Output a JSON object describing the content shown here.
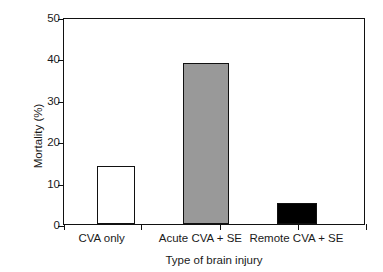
{
  "chart_data": {
    "type": "bar",
    "title": "",
    "subtitle": "",
    "xlabel": "Type of brain injury",
    "ylabel": "Mortality (%)",
    "categories": [
      "CVA only",
      "Acute CVA + SE",
      "Remote CVA + SE"
    ],
    "values": [
      14,
      39,
      5
    ],
    "series": [
      {
        "name": "Mortality",
        "values": [
          14,
          39,
          5
        ]
      }
    ],
    "ylim": [
      0,
      50
    ],
    "yticks": [
      0,
      10,
      20,
      30,
      40,
      50
    ],
    "ytick_labels": [
      "0",
      "10",
      "20",
      "30",
      "40",
      "50"
    ],
    "grid": false,
    "legend": "none",
    "bar_styles": [
      {
        "category": "CVA only",
        "fill": "#ffffff",
        "edge": "#111111",
        "style": "open"
      },
      {
        "category": "Acute CVA + SE",
        "fill": "#999999",
        "edge": "#111111",
        "style": "gray"
      },
      {
        "category": "Remote CVA + SE",
        "fill": "#000000",
        "edge": "#111111",
        "style": "black"
      }
    ],
    "bar_centers_pct": [
      11.0,
      39.5,
      70.5
    ],
    "bar_width_pct": [
      12.6,
      15.0,
      13.3
    ],
    "axis_color": "#111111",
    "background": "#ffffff"
  }
}
